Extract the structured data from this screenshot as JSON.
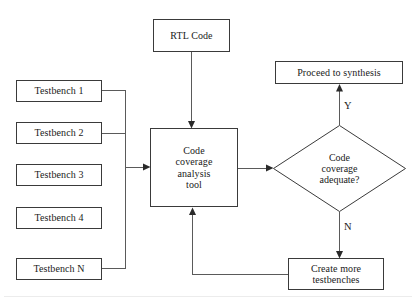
{
  "diagram": {
    "stroke_color": "#3a3a3a",
    "wire_color": "#5a5a5a",
    "background": "#ffffff",
    "nodes": {
      "rtl_code": {
        "label": "RTL Code",
        "shape": "rectangle"
      },
      "testbench_1": {
        "label": "Testbench 1",
        "shape": "rectangle"
      },
      "testbench_2": {
        "label": "Testbench 2",
        "shape": "rectangle"
      },
      "testbench_3": {
        "label": "Testbench 3",
        "shape": "rectangle"
      },
      "testbench_4": {
        "label": "Testbench 4",
        "shape": "rectangle"
      },
      "testbench_n": {
        "label": "Testbench N",
        "shape": "rectangle"
      },
      "analysis_tool": {
        "shape": "rectangle",
        "line1": "Code",
        "line2": "coverage",
        "line3": "analysis",
        "line4": "tool"
      },
      "decision": {
        "shape": "diamond",
        "line1": "Code",
        "line2": "coverage",
        "line3": "adequate?"
      },
      "proceed": {
        "label": "Proceed to synthesis",
        "shape": "rectangle"
      },
      "create_more": {
        "shape": "rectangle",
        "line1": "Create more",
        "line2": "testbenches"
      }
    },
    "edge_labels": {
      "yes": "Y",
      "no": "N"
    }
  }
}
